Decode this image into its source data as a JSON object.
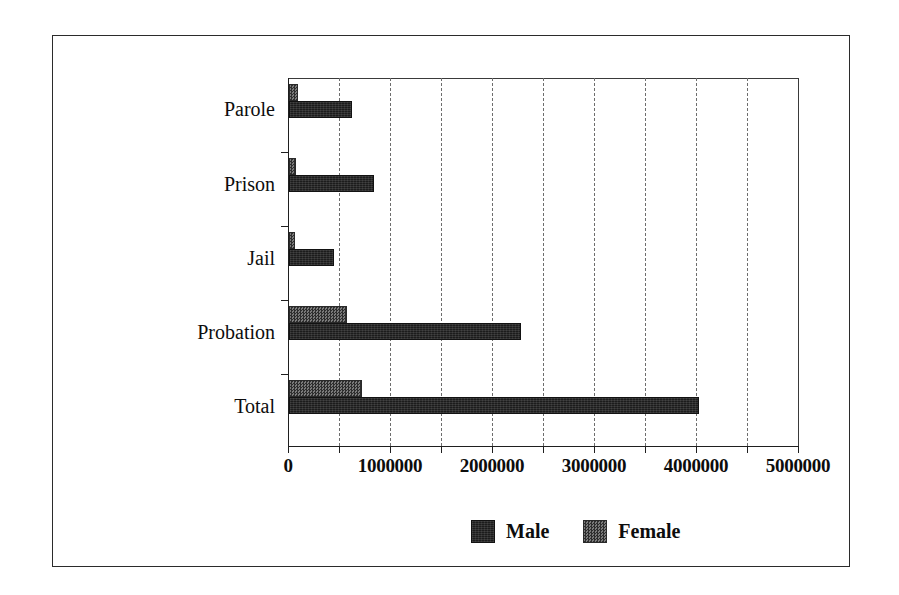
{
  "chart_data": {
    "type": "bar",
    "orientation": "horizontal",
    "title": "",
    "xlabel": "",
    "ylabel": "",
    "categories": [
      "Parole",
      "Prison",
      "Jail",
      "Probation",
      "Total"
    ],
    "series": [
      {
        "name": "Male",
        "values": [
          620000,
          830000,
          440000,
          2270000,
          4020000
        ]
      },
      {
        "name": "Female",
        "values": [
          90000,
          65000,
          55000,
          570000,
          720000
        ]
      }
    ],
    "xlim": [
      0,
      5000000
    ],
    "xticks": [
      0,
      1000000,
      2000000,
      3000000,
      4000000,
      5000000
    ],
    "xtick_labels": [
      "0",
      "1000000",
      "2000000",
      "3000000",
      "4000000",
      "5000000"
    ],
    "minor_tick_interval": 500000,
    "gridlines": {
      "vertical": true,
      "style": "dashed",
      "positions": [
        500000,
        1000000,
        1500000,
        2000000,
        2500000,
        3000000,
        3500000,
        4000000,
        4500000
      ]
    },
    "legend": {
      "position": "bottom-center",
      "entries": [
        {
          "label": "Male",
          "color": "#1c1c1c",
          "fill": "solid"
        },
        {
          "label": "Female",
          "color": "#4a4a4a",
          "fill": "dithered"
        }
      ]
    },
    "frame": {
      "outer_border": true,
      "plot_border": true
    }
  }
}
